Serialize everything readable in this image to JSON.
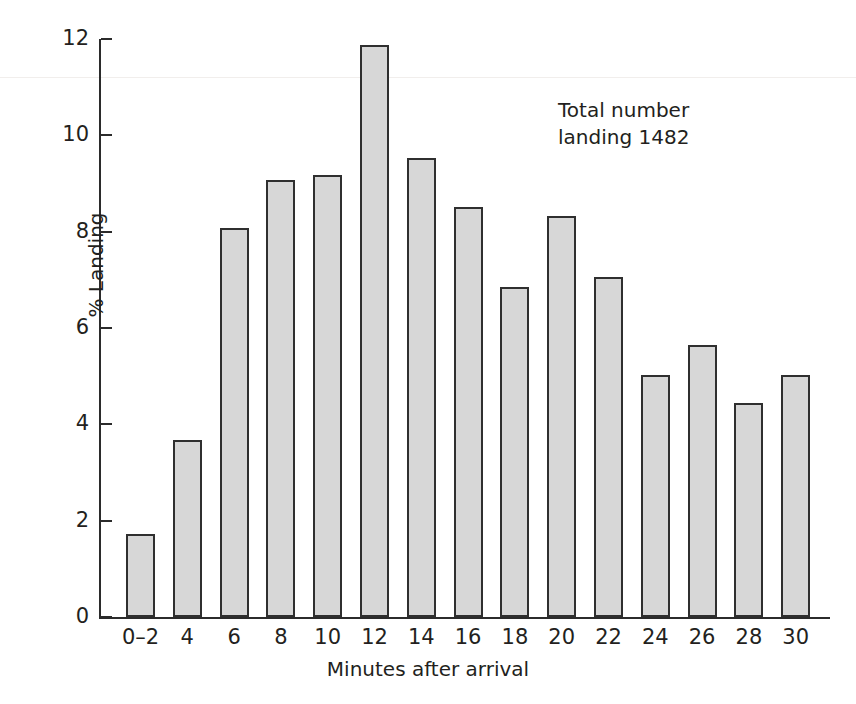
{
  "chart_data": {
    "type": "bar",
    "title": "",
    "subtitle": "",
    "xlabel": "Minutes after arrival",
    "ylabel": "% Landing",
    "categories": [
      "0–2",
      "4",
      "6",
      "8",
      "10",
      "12",
      "14",
      "16",
      "18",
      "20",
      "22",
      "24",
      "26",
      "28",
      "30"
    ],
    "values": [
      1.72,
      3.67,
      8.07,
      9.07,
      9.18,
      11.88,
      9.52,
      8.52,
      6.85,
      8.32,
      7.05,
      5.02,
      5.65,
      4.44,
      5.02
    ],
    "ylim": [
      0,
      12
    ],
    "xlim_note": "categorical, 15 bins of 2 minutes",
    "y_ticks": [
      "0",
      "2",
      "4",
      "6",
      "8",
      "10",
      "12"
    ],
    "y_tick_values": [
      0,
      2,
      4,
      6,
      8,
      10,
      12
    ],
    "grid": false,
    "legend": "none",
    "annotations": [
      {
        "text": "Total number\nlanding 1482",
        "position": "upper-right"
      }
    ],
    "colors": {
      "bar_fill": "#d7d7d7",
      "bar_border": "#2f2f2f",
      "axis": "#2b2b2b",
      "text": "#231f20",
      "background": "#ffffff"
    }
  }
}
